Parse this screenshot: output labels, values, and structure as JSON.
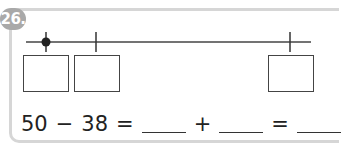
{
  "problem": {
    "number_label": "26.",
    "badge_color": "#a9a9a9",
    "frame_color": "#d6d6d6"
  },
  "number_line": {
    "start_marker": "dot",
    "ticks": 2,
    "answer_boxes": 3
  },
  "equation": {
    "left_operand": "50",
    "operator_minus": "−",
    "right_operand": "38",
    "equals_1": "=",
    "plus": "+",
    "equals_2": "=",
    "blanks": [
      "",
      "",
      ""
    ]
  }
}
